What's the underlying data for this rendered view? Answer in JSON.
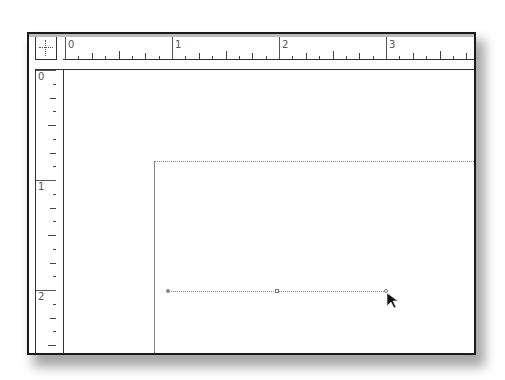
{
  "app": {
    "type": "desktop-publishing-document-window"
  },
  "horizontal_ruler": {
    "labels": [
      "0",
      "1",
      "2",
      "3"
    ],
    "unit_spacing_px": 107,
    "subdivisions": 8
  },
  "vertical_ruler": {
    "labels": [
      "0",
      "1",
      "2"
    ],
    "unit_spacing_px": 110,
    "subdivisions": 8
  },
  "ruler_origin_corner": {
    "icon": "crosshair-icon"
  },
  "canvas": {
    "page_edge_style": "dotted-top solid-left",
    "path": {
      "type": "line",
      "anchor_points": [
        "start",
        "midpoint",
        "end"
      ],
      "stroke_style": "dotted"
    }
  },
  "cursor": {
    "icon": "arrow-cursor-icon"
  },
  "colors": {
    "frame": "#1a1a1a",
    "ruler_tick": "#444444",
    "ruler_label": "#555555",
    "guide": "#888888",
    "background": "#ffffff"
  }
}
